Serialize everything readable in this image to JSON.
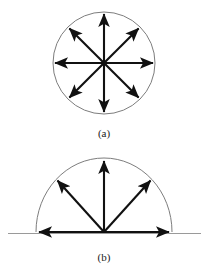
{
  "figure": {
    "background_color": "#ffffff",
    "stroke_color": "#111111",
    "outline_color": "#7d7d7d",
    "baseline_color": "#9a9a9a",
    "panels": [
      {
        "id": "panel-a",
        "caption": "(a)",
        "caption_x": 104,
        "caption_y": 133,
        "shape": "circle",
        "center_x": 104,
        "center_y": 63,
        "radius": 51,
        "arrow_count": 8,
        "angles_deg": [
          0,
          45,
          90,
          135,
          180,
          225,
          270,
          315
        ],
        "arrow_length": 50,
        "description": "full circle with eight radial arrows at 45 degree spacing"
      },
      {
        "id": "panel-b",
        "caption": "(b)",
        "caption_x": 104,
        "caption_y": 257,
        "shape": "semicircle",
        "center_x": 104,
        "center_y": 232,
        "radius": 68,
        "radius_y": 74,
        "arrow_count": 4,
        "angles_deg": [
          0,
          45,
          90,
          135,
          180
        ],
        "arrow_length": 67,
        "baseline_x1": 8,
        "baseline_x2": 201,
        "baseline_y": 234,
        "description": "upper half circle with arrows at 0, 45, 90, 135 and 180 degrees plus a horizontal ground line"
      }
    ]
  }
}
